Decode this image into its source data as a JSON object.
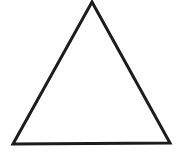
{
  "figure": {
    "name": "triangle-outline",
    "shape_type": "triangle",
    "canvas": {
      "width": 176,
      "height": 162,
      "background_color": "#ffffff"
    },
    "stroke": {
      "color": "#1c1c1c",
      "width_px": 3,
      "style": "solid"
    },
    "fill_color": "#ffffff",
    "vertices": [
      {
        "label": "apex",
        "x": 92,
        "y": 2
      },
      {
        "label": "bottom-right",
        "x": 170,
        "y": 143
      },
      {
        "label": "bottom-left",
        "x": 13,
        "y": 144
      }
    ],
    "points_attribute": "92,2 170,143 13,144",
    "labels": [],
    "caption": ""
  }
}
